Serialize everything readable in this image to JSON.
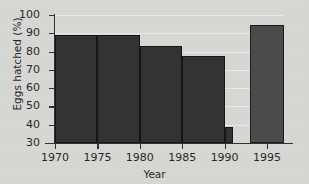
{
  "chart_data": {
    "type": "bar",
    "title": "",
    "xlabel": "Year",
    "ylabel": "Eggs hatched (%)",
    "xlim": [
      1970,
      1997
    ],
    "ylim": [
      30,
      100
    ],
    "grid": true,
    "legend": "none",
    "y_ticks": [
      30,
      40,
      50,
      60,
      70,
      80,
      90,
      100
    ],
    "y_tick_labels": [
      "30",
      "40",
      "50",
      "60",
      "70",
      "80",
      "90",
      "100"
    ],
    "x_ticks": [
      1970,
      1975,
      1980,
      1985,
      1990,
      1995
    ],
    "x_tick_labels": [
      "1970",
      "1975",
      "1980",
      "1985",
      "1990",
      "1995"
    ],
    "categories": [
      "1970-1975",
      "1975-1980",
      "1980-1985",
      "1985-1990",
      "1990",
      "1995"
    ],
    "values": [
      89,
      89,
      83,
      77.5,
      38.5,
      94.5
    ],
    "bars": [
      {
        "label": "1970-1975",
        "x_start": 1970,
        "x_end": 1975,
        "value": 89,
        "color": "#2b2b2b"
      },
      {
        "label": "1975-1980",
        "x_start": 1975,
        "x_end": 1980,
        "value": 89,
        "color": "#2b2b2b"
      },
      {
        "label": "1980-1985",
        "x_start": 1980,
        "x_end": 1985,
        "value": 83,
        "color": "#2b2b2b"
      },
      {
        "label": "1985-1990",
        "x_start": 1985,
        "x_end": 1990,
        "value": 77.5,
        "color": "#2b2b2b"
      },
      {
        "label": "1990",
        "x_start": 1990,
        "x_end": 1991,
        "value": 38.5,
        "color": "#2b2b2b"
      },
      {
        "label": "1995",
        "x_start": 1993,
        "x_end": 1997,
        "value": 94.5,
        "color": "#454545"
      }
    ],
    "colors": {
      "bar_dark": "#2b2b2b",
      "bar_light": "#454545",
      "bar_outline": "#0c0c0c",
      "background": "#dadad7",
      "axis": "#2a2a2a",
      "text": "#1c1c1c",
      "gridline": "#ffffff"
    }
  }
}
